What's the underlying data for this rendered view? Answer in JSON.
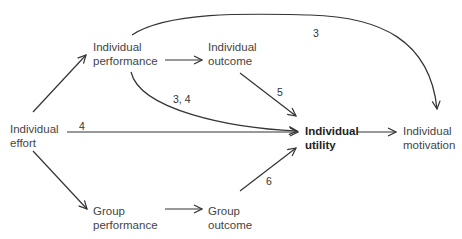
{
  "diagram": {
    "type": "flow-diagram",
    "nodes": {
      "individual_effort": {
        "line1": "Individual",
        "line2": "effort"
      },
      "individual_performance": {
        "line1": "Individual",
        "line2": "performance"
      },
      "individual_outcome": {
        "line1": "Individual",
        "line2": "outcome"
      },
      "group_performance": {
        "line1": "Group",
        "line2": "performance"
      },
      "group_outcome": {
        "line1": "Group",
        "line2": "outcome"
      },
      "individual_utility": {
        "line1": "Individual",
        "line2": "utility"
      },
      "individual_motivation": {
        "line1": "Individual",
        "line2": "motivation"
      }
    },
    "edge_labels": {
      "perf_to_motivation": "3",
      "perf_to_utility": "3, 4",
      "outcome_to_utility": "5",
      "effort_to_utility": "4",
      "effort_to_group_perf": "6",
      "group_outcome_to_utility": "6"
    },
    "edges": [
      {
        "from": "Individual effort",
        "to": "Individual performance",
        "label": ""
      },
      {
        "from": "Individual performance",
        "to": "Individual outcome",
        "label": ""
      },
      {
        "from": "Individual performance",
        "to": "Individual motivation",
        "label": "3"
      },
      {
        "from": "Individual performance",
        "to": "Individual utility",
        "label": "3, 4"
      },
      {
        "from": "Individual outcome",
        "to": "Individual utility",
        "label": "5"
      },
      {
        "from": "Individual effort",
        "to": "Individual utility",
        "label": "4"
      },
      {
        "from": "Individual effort",
        "to": "Group performance",
        "label": "6"
      },
      {
        "from": "Group performance",
        "to": "Group outcome",
        "label": ""
      },
      {
        "from": "Group outcome",
        "to": "Individual utility",
        "label": "6"
      },
      {
        "from": "Individual utility",
        "to": "Individual motivation",
        "label": ""
      }
    ]
  }
}
